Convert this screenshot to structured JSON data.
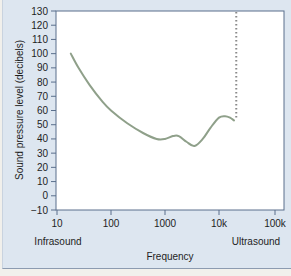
{
  "chart_data": {
    "type": "line",
    "title": "",
    "xlabel": "Frequency",
    "ylabel": "Sound pressure level (decibels)",
    "xscale": "log",
    "xlim": [
      10,
      100000
    ],
    "ylim": [
      -10,
      130
    ],
    "x_ticks": [
      "10",
      "100",
      "1000",
      "10k",
      "100k"
    ],
    "y_ticks": [
      "130",
      "120",
      "110",
      "100",
      "90",
      "80",
      "70",
      "60",
      "50",
      "40",
      "30",
      "20",
      "10",
      "0",
      "−10"
    ],
    "annotations": [
      {
        "text": "Infrasound",
        "position": "below x=10"
      },
      {
        "text": "Ultrasound",
        "position": "below x=100k"
      }
    ],
    "grid": false,
    "legend": null,
    "series": [
      {
        "name": "Threshold of hearing",
        "style": "solid",
        "color": "#8fa08a",
        "x": [
          18,
          25,
          40,
          70,
          100,
          200,
          400,
          700,
          1000,
          1400,
          1800,
          2500,
          3500,
          5000,
          7000,
          10000,
          13000,
          16000,
          19000
        ],
        "y": [
          100,
          90,
          78,
          66,
          60,
          51,
          44,
          40,
          40,
          42,
          42,
          38,
          35,
          40,
          48,
          55,
          56,
          55,
          53
        ]
      },
      {
        "name": "Upper frequency limit",
        "style": "dotted",
        "color": "#8a8a8a",
        "x": [
          20000,
          20000
        ],
        "y": [
          55,
          130
        ]
      }
    ]
  },
  "labels": {
    "y_axis": "Sound pressure level (decibels)",
    "x_axis": "Frequency",
    "infrasound": "Infrasound",
    "ultrasound": "Ultrasound"
  },
  "colors": {
    "frame_bg": "#dde6f0",
    "plot_bg": "#ffffff",
    "axis": "#5a6f8c",
    "curve": "#8fa08a",
    "dotted": "#8a8a8a"
  }
}
